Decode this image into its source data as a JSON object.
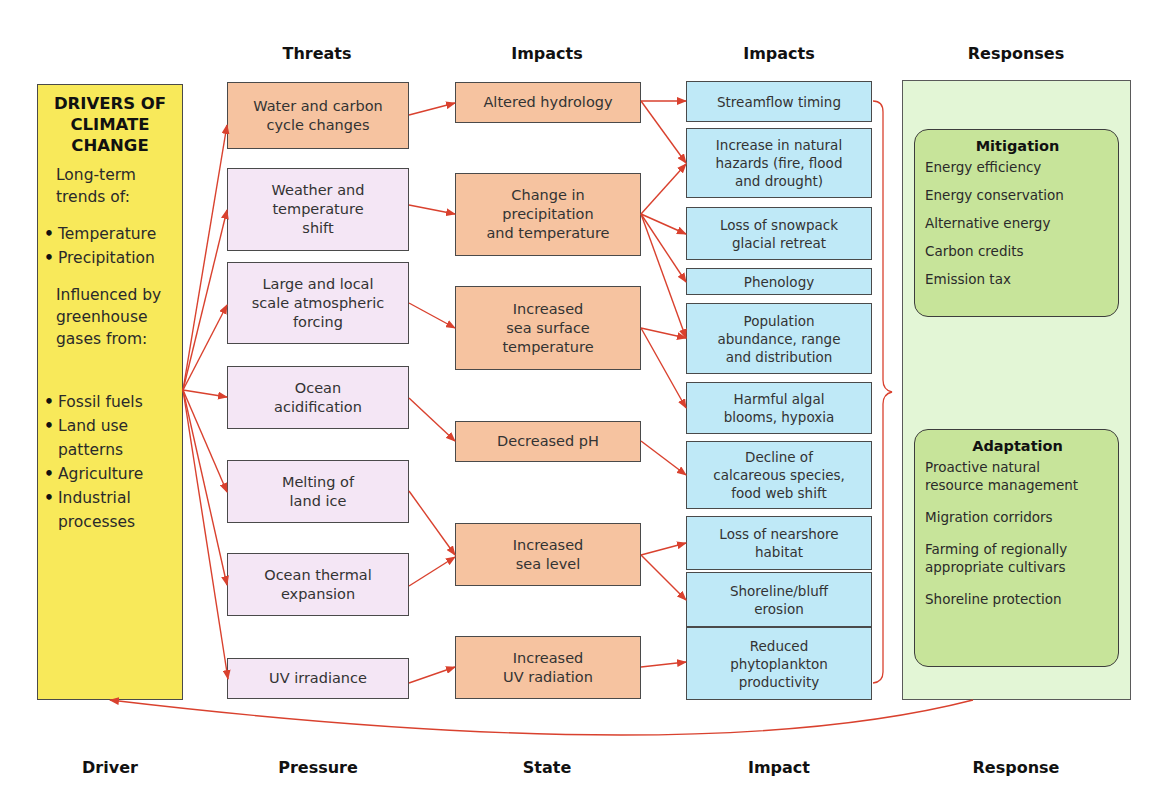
{
  "column_headers": {
    "threats": "Threats",
    "impacts_state": "Impacts",
    "impacts": "Impacts",
    "responses": "Responses"
  },
  "footer_labels": {
    "driver": "Driver",
    "pressure": "Pressure",
    "state": "State",
    "impact": "Impact",
    "response": "Response"
  },
  "driver": {
    "title": "DRIVERS OF\nCLIMATE\nCHANGE",
    "trends_intro": "Long-term\ntrends of:",
    "trends": [
      "Temperature",
      "Precipitation"
    ],
    "influence_intro": "Influenced by\ngreenhouse\ngases from:",
    "sources": [
      "Fossil fuels",
      "Land use\npatterns",
      "Agriculture",
      "Industrial\nprocesses"
    ]
  },
  "threats": [
    {
      "label": "Water and carbon\ncycle changes",
      "color": "#f6c3a0"
    },
    {
      "label": "Weather and\ntemperature\nshift",
      "color": "#f4e6f5"
    },
    {
      "label": "Large and local\nscale atmospheric\nforcing",
      "color": "#f4e6f5"
    },
    {
      "label": "Ocean\nacidification",
      "color": "#f4e6f5"
    },
    {
      "label": "Melting of\nland ice",
      "color": "#f4e6f5"
    },
    {
      "label": "Ocean thermal\nexpansion",
      "color": "#f4e6f5"
    },
    {
      "label": "UV irradiance",
      "color": "#f4e6f5"
    }
  ],
  "states": [
    {
      "label": "Altered hydrology"
    },
    {
      "label": "Change in\nprecipitation\nand temperature"
    },
    {
      "label": "Increased\nsea surface\ntemperature"
    },
    {
      "label": "Decreased pH"
    },
    {
      "label": "Increased\nsea level"
    },
    {
      "label": "Increased\nUV radiation"
    }
  ],
  "impacts": [
    {
      "label": "Streamflow timing"
    },
    {
      "label": "Increase in natural\nhazards (fire, flood\nand drought)"
    },
    {
      "label": "Loss of snowpack\nglacial retreat"
    },
    {
      "label": "Phenology"
    },
    {
      "label": "Population\nabundance, range\nand distribution"
    },
    {
      "label": "Harmful algal\nblooms, hypoxia"
    },
    {
      "label": "Decline of\ncalcareous species,\nfood web shift"
    },
    {
      "label": "Loss of nearshore\nhabitat"
    },
    {
      "label": "Shoreline/bluff\nerosion"
    },
    {
      "label": "Reduced\nphytoplankton\nproductivity"
    }
  ],
  "responses": {
    "mitigation": {
      "title": "Mitigation",
      "items": [
        "Energy efficiency",
        "Energy conservation",
        "Alternative energy",
        "Carbon credits",
        "Emission tax"
      ]
    },
    "adaptation": {
      "title": "Adaptation",
      "items": [
        "Proactive natural\nresource management",
        "Migration corridors",
        "Farming of regionally\nappropriate cultivars",
        "Shoreline protection"
      ]
    }
  },
  "colors": {
    "driver": "#f8e95a",
    "threat_orange": "#f6c3a0",
    "threat_pink": "#f4e6f5",
    "state": "#f6c3a0",
    "impact": "#bfe9f7",
    "responses_panel": "#e3f6d6",
    "response_group": "#c7e49a",
    "arrow": "#d9412e"
  }
}
